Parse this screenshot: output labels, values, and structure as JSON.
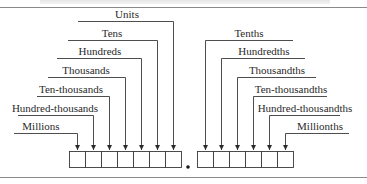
{
  "diagram": {
    "title_visible": false,
    "integer_places": [
      {
        "label": "Units"
      },
      {
        "label": "Tens"
      },
      {
        "label": "Hundreds"
      },
      {
        "label": "Thousands"
      },
      {
        "label": "Ten-thousands"
      },
      {
        "label": "Hundred-thousands"
      },
      {
        "label": "Millions"
      }
    ],
    "decimal_places": [
      {
        "label": "Tenths"
      },
      {
        "label": "Hundredths"
      },
      {
        "label": "Thousandths"
      },
      {
        "label": "Ten-thousandths"
      },
      {
        "label": "Hundred-thousandths"
      },
      {
        "label": "Millionths"
      }
    ],
    "decimal_point": ".",
    "integer_box_count": 7,
    "decimal_box_count": 6,
    "colors": {
      "line": "#3a3a3a",
      "rule": "#8a8a8a",
      "text": "#2a2a2a"
    }
  }
}
